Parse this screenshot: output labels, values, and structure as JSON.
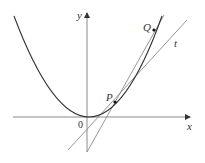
{
  "diagram": {
    "type": "secant-tangent-parabola",
    "labels": {
      "x_axis": "x",
      "y_axis": "y",
      "origin": "0",
      "point_p": "P",
      "point_q": "Q",
      "tangent": "t"
    },
    "elements": [
      "parabola",
      "x-axis",
      "y-axis",
      "secant line PQ",
      "tangent line t at P",
      "point P",
      "point Q"
    ],
    "colors": {
      "curve": "#333333",
      "axes": "#8a8a8a",
      "lines": "#8a8a8a",
      "points": "#111111"
    }
  }
}
